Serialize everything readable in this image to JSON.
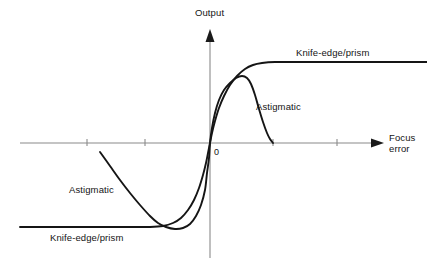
{
  "figure": {
    "kind": "focus-error-signal-diagram",
    "background_color": "#ffffff",
    "axis_color": "#8a8a8a",
    "curve_color": "#151515"
  },
  "axes": {
    "y_axis_label": "Output",
    "x_axis_label_line1": "Focus",
    "x_axis_label_line2": "error",
    "origin_label": "0",
    "origin_px": {
      "x": 210,
      "y": 143
    },
    "x_axis_start_px": 20,
    "x_axis_end_px": 383,
    "y_axis_top_px": 30,
    "y_axis_bottom_px": 258,
    "x_ticks_px": [
      87,
      145,
      273,
      337
    ],
    "tick_length_px": 7,
    "grid": false
  },
  "labels": {
    "knife_edge_upper": "Knife-edge/prism",
    "knife_edge_lower": "Knife-edge/prism",
    "astigmatic_upper": "Astigmatic",
    "astigmatic_lower": "Astigmatic"
  },
  "caption": {
    "cropped_text": "                                                                                                            "
  },
  "chart_data": {
    "type": "line",
    "title": "",
    "xlabel": "Focus error",
    "ylabel": "Output",
    "grid": false,
    "legend": "inline-annotations",
    "annotations": [
      {
        "text": "Knife-edge/prism",
        "x_px": 296,
        "y_px": 47
      },
      {
        "text": "Astigmatic",
        "x_px": 256,
        "y_px": 101
      },
      {
        "text": "Astigmatic",
        "x_px": 69,
        "y_px": 184
      },
      {
        "text": "Knife-edge/prism",
        "x_px": 50,
        "y_px": 232
      },
      {
        "text": "0",
        "x_px": 214,
        "y_px": 147
      }
    ],
    "series": [
      {
        "name": "Knife-edge/prism",
        "description": "Monotonic S-shaped curve saturating at both extremes",
        "points_px": [
          [
            20,
            227
          ],
          [
            60,
            227
          ],
          [
            100,
            227
          ],
          [
            130,
            227
          ],
          [
            150,
            227
          ],
          [
            163,
            226
          ],
          [
            173,
            223
          ],
          [
            181,
            218
          ],
          [
            188,
            210
          ],
          [
            194,
            200
          ],
          [
            199,
            188
          ],
          [
            203,
            175
          ],
          [
            206,
            163
          ],
          [
            208,
            153
          ],
          [
            210,
            143
          ],
          [
            212,
            133
          ],
          [
            215,
            121
          ],
          [
            219,
            108
          ],
          [
            224,
            96
          ],
          [
            230,
            85
          ],
          [
            237,
            76
          ],
          [
            245,
            69
          ],
          [
            253,
            65
          ],
          [
            262,
            63
          ],
          [
            275,
            62
          ],
          [
            300,
            62
          ],
          [
            340,
            62
          ],
          [
            380,
            62
          ],
          [
            427,
            62
          ]
        ]
      },
      {
        "name": "Astigmatic",
        "description": "S-shaped curve that overshoots to a peak then decays back toward zero on each side",
        "points_px": [
          [
            100,
            152
          ],
          [
            110,
            166
          ],
          [
            120,
            180
          ],
          [
            130,
            193
          ],
          [
            140,
            205
          ],
          [
            150,
            216
          ],
          [
            158,
            223
          ],
          [
            166,
            227
          ],
          [
            175,
            229
          ],
          [
            183,
            228
          ],
          [
            190,
            224
          ],
          [
            196,
            216
          ],
          [
            201,
            205
          ],
          [
            205,
            190
          ],
          [
            207,
            173
          ],
          [
            209,
            158
          ],
          [
            210,
            143
          ],
          [
            212,
            128
          ],
          [
            215,
            113
          ],
          [
            219,
            100
          ],
          [
            224,
            90
          ],
          [
            230,
            83
          ],
          [
            236,
            78
          ],
          [
            242,
            76
          ],
          [
            247,
            78
          ],
          [
            251,
            84
          ],
          [
            255,
            95
          ],
          [
            259,
            109
          ],
          [
            263,
            122
          ],
          [
            267,
            133
          ],
          [
            270,
            139
          ],
          [
            273,
            143
          ]
        ]
      }
    ],
    "notes": [
      "Both curves pass through the origin (zero focus error, zero output).",
      "Knife-edge/prism response saturates at a constant positive output for large positive focus error and constant negative output for large negative focus error.",
      "Astigmatic response peaks shortly after the origin and then falls back toward zero, giving a limited capture range."
    ]
  }
}
